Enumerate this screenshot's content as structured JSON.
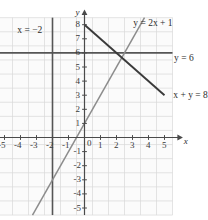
{
  "figure": {
    "type": "line-graph",
    "background": "#ffffff",
    "grid_color": "#d8d8d8",
    "axis_color": "#4a4a4a",
    "text_color": "#2b2b2b"
  },
  "axes": {
    "x_axis_label": "x",
    "y_axis_label": "y",
    "x_ticks": [
      "-5",
      "-4",
      "-3",
      "-2",
      "-1",
      "0",
      "1",
      "2",
      "3",
      "4",
      "5"
    ],
    "y_ticks": [
      "8",
      "7",
      "6",
      "5",
      "4",
      "3",
      "2",
      "1",
      "-1",
      "-2",
      "-3",
      "-4",
      "-5"
    ],
    "origin_label": "0",
    "xlim": [
      -5.5,
      5.5
    ],
    "ylim": [
      -5.5,
      8.5
    ]
  },
  "labels": {
    "vertical_line": "x = −2",
    "steep_line": "y = 2x + 1",
    "horizontal_line": "y = 6",
    "falling_line": "x + y = 8"
  },
  "chart_data": {
    "type": "line",
    "title": "",
    "xlabel": "x",
    "ylabel": "y",
    "xlim": [
      -5.5,
      5.5
    ],
    "ylim": [
      -5.5,
      8.5
    ],
    "grid": true,
    "legend": "inline-annotations",
    "series": [
      {
        "name": "x = -2",
        "equation": "x = −2",
        "color": "#555555",
        "kind": "vertical",
        "x": [
          -2,
          -2
        ],
        "y": [
          -5.5,
          8.5
        ],
        "label_position": [
          -3.6,
          7.6
        ]
      },
      {
        "name": "y = 6",
        "equation": "y = 6",
        "color": "#555555",
        "kind": "horizontal",
        "x": [
          -5.5,
          5.5
        ],
        "y": [
          6,
          6
        ],
        "label_position": [
          5.7,
          5.6
        ]
      },
      {
        "name": "x + y = 8",
        "equation": "x + y = 8",
        "color": "#3a3a3a",
        "kind": "oblique",
        "slope": -1,
        "intercept": 8,
        "x": [
          0,
          5
        ],
        "y": [
          8,
          3
        ],
        "label_position": [
          5.7,
          3.0
        ]
      },
      {
        "name": "y = 2x + 1",
        "equation": "y = 2x + 1",
        "color": "#8c8c8c",
        "kind": "oblique",
        "slope": 2,
        "intercept": 1,
        "x": [
          -3.25,
          3.75
        ],
        "y": [
          -5.5,
          8.5
        ],
        "label_position": [
          3.3,
          8.1
        ]
      }
    ],
    "intersections": [
      {
        "of": [
          "x + y = 8",
          "y = 6"
        ],
        "point": [
          2,
          6
        ]
      },
      {
        "of": [
          "y = 2x + 1",
          "y = 6"
        ],
        "point": [
          2.5,
          6
        ]
      },
      {
        "of": [
          "y = 2x + 1",
          "x + y = 8"
        ],
        "point": [
          2.333,
          5.667
        ]
      }
    ]
  }
}
